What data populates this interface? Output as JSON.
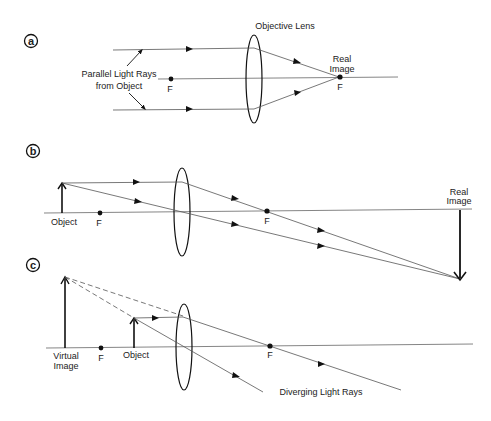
{
  "figure": {
    "colors": {
      "line": "#555555",
      "ink": "#111111",
      "background": "#ffffff"
    }
  },
  "panels": [
    {
      "id": "a",
      "label": "a",
      "texts": {
        "lens_label": "Objective Lens",
        "rays_label_line1": "Parallel Light Rays",
        "rays_label_line2": "from Object",
        "focal_left": "F",
        "image_label_line1": "Real",
        "image_label_line2": "Image",
        "focal_right": "F"
      }
    },
    {
      "id": "b",
      "label": "b",
      "texts": {
        "object_label": "Object",
        "focal_left": "F",
        "focal_right": "F",
        "image_label_line1": "Real",
        "image_label_line2": "Image"
      }
    },
    {
      "id": "c",
      "label": "c",
      "texts": {
        "virtual_label_line1": "Virtual",
        "virtual_label_line2": "Image",
        "focal_left": "F",
        "object_label": "Object",
        "focal_right": "F",
        "rays_label": "Diverging Light Rays"
      }
    }
  ]
}
